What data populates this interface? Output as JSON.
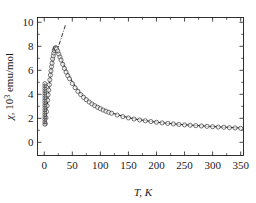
{
  "figure": {
    "name": "magnetic-susceptibility-vs-temperature",
    "background": "#ffffff",
    "ink": "#1a1a1a"
  },
  "chart_data": {
    "type": "scatter",
    "title": "",
    "subtitle": "",
    "xlabel": "T, K",
    "ylabel": "χ, 10³ emu/mol",
    "ylabel_parts": {
      "symbol": "χ",
      "comma": ", ",
      "mantissa": "10",
      "exponent": "3",
      "unit": " emu/mol"
    },
    "xlim": [
      -12,
      355
    ],
    "ylim": [
      -1.1,
      10.4
    ],
    "xticks": [
      0,
      50,
      100,
      150,
      200,
      250,
      300,
      350
    ],
    "xtick_labels": [
      "0",
      "50",
      "100",
      "150",
      "200",
      "250",
      "300",
      "350"
    ],
    "xminor_step": 25,
    "yticks": [
      0,
      2,
      4,
      6,
      8,
      10
    ],
    "ytick_labels": [
      "0",
      "2",
      "4",
      "6",
      "8",
      "10"
    ],
    "yminor_step": 1,
    "grid": false,
    "legend": null,
    "tick_direction": "in",
    "frame": "box",
    "series": [
      {
        "name": "chi-measured",
        "marker": "open-circle",
        "marker_size": 3.0,
        "color": "#1a1a1a",
        "linestyle": "none",
        "x": [
          2,
          3,
          4,
          5,
          6,
          7,
          8,
          9,
          10,
          11,
          12,
          13,
          14,
          15,
          16,
          17,
          18,
          19,
          20,
          21,
          22,
          24,
          26,
          28,
          30,
          33,
          36,
          39,
          42,
          45,
          50,
          55,
          60,
          65,
          70,
          75,
          80,
          85,
          90,
          95,
          100,
          105,
          110,
          115,
          120,
          130,
          140,
          150,
          160,
          170,
          180,
          190,
          200,
          210,
          220,
          230,
          240,
          250,
          260,
          270,
          280,
          290,
          300,
          310,
          320,
          330,
          340,
          350
        ],
        "y": [
          1.55,
          2.05,
          2.55,
          3.05,
          3.5,
          3.95,
          4.35,
          4.8,
          5.2,
          5.6,
          5.95,
          6.3,
          6.6,
          6.95,
          7.2,
          7.45,
          7.65,
          7.8,
          7.88,
          7.85,
          7.78,
          7.6,
          7.35,
          7.1,
          6.85,
          6.5,
          6.15,
          5.85,
          5.55,
          5.3,
          4.9,
          4.55,
          4.25,
          3.98,
          3.75,
          3.55,
          3.36,
          3.2,
          3.05,
          2.92,
          2.8,
          2.69,
          2.59,
          2.5,
          2.42,
          2.27,
          2.14,
          2.03,
          1.94,
          1.86,
          1.79,
          1.73,
          1.67,
          1.62,
          1.57,
          1.53,
          1.49,
          1.45,
          1.42,
          1.39,
          1.36,
          1.33,
          1.3,
          1.27,
          1.25,
          1.22,
          1.2,
          1.17
        ]
      },
      {
        "name": "chi-fit-curve",
        "marker": "none",
        "linestyle": "solid",
        "linewidth": 1.0,
        "color": "#1a1a1a",
        "x": [
          2,
          4,
          6,
          8,
          10,
          12,
          14,
          16,
          18,
          20,
          22,
          25,
          28,
          32,
          36,
          40,
          45,
          50,
          55,
          60,
          70,
          80,
          90,
          100,
          110,
          120,
          130,
          140,
          150,
          160,
          170,
          180,
          190,
          200,
          210,
          220,
          230,
          240,
          250,
          260,
          270,
          280,
          290,
          300,
          310,
          320,
          330,
          340,
          350
        ],
        "y": [
          1.45,
          2.45,
          3.45,
          4.3,
          5.12,
          5.85,
          6.5,
          7.05,
          7.5,
          7.78,
          7.72,
          7.5,
          7.18,
          6.78,
          6.32,
          5.92,
          5.48,
          5.05,
          4.68,
          4.35,
          3.82,
          3.42,
          3.1,
          2.84,
          2.62,
          2.45,
          2.3,
          2.17,
          2.06,
          1.96,
          1.88,
          1.81,
          1.74,
          1.68,
          1.63,
          1.58,
          1.54,
          1.5,
          1.46,
          1.43,
          1.4,
          1.37,
          1.34,
          1.31,
          1.29,
          1.26,
          1.24,
          1.21,
          1.19
        ]
      },
      {
        "name": "low-temperature-cluster",
        "marker": "open-circle-dense",
        "color": "#1a1a1a",
        "linestyle": "none",
        "x": [
          1,
          1,
          1,
          1,
          1,
          1,
          1,
          1,
          1,
          1,
          1,
          1,
          1,
          1,
          1,
          1,
          1,
          1
        ],
        "y": [
          1.5,
          1.7,
          1.9,
          2.1,
          2.3,
          2.5,
          2.7,
          2.9,
          3.1,
          3.3,
          3.5,
          3.7,
          3.9,
          4.1,
          4.3,
          4.5,
          4.7,
          4.9
        ]
      },
      {
        "name": "curie-weiss-guide-line",
        "marker": "none",
        "linestyle": "dashdot",
        "linewidth": 0.9,
        "color": "#1a1a1a",
        "x": [
          22,
          38
        ],
        "y": [
          7.5,
          9.8
        ]
      }
    ],
    "annotations": []
  }
}
